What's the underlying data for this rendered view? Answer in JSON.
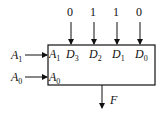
{
  "diagram": {
    "type": "4-to-1 multiplexer block",
    "data_inputs": [
      {
        "name": "D3",
        "value": "0"
      },
      {
        "name": "D2",
        "value": "1"
      },
      {
        "name": "D1",
        "value": "1"
      },
      {
        "name": "D0",
        "value": "0"
      }
    ],
    "select_inputs": [
      {
        "external": "A1",
        "internal": "A1"
      },
      {
        "external": "A0",
        "internal": "A0"
      }
    ],
    "output": "F"
  }
}
